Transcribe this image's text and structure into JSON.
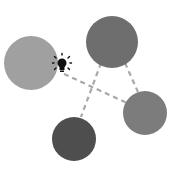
{
  "diagram": {
    "nodes": [
      {
        "id": "left",
        "cx": 31,
        "cy": 63,
        "r": 27,
        "color": "#a0a0a0"
      },
      {
        "id": "top",
        "cx": 112,
        "cy": 42,
        "r": 26,
        "color": "#6e6e6e"
      },
      {
        "id": "right",
        "cx": 145,
        "cy": 113,
        "r": 22,
        "color": "#7c7c7c"
      },
      {
        "id": "bottom",
        "cx": 74,
        "cy": 139,
        "r": 22,
        "color": "#4e4e4e"
      }
    ],
    "edges": [
      {
        "from": "left-bulb",
        "to": "right",
        "style": "dashed"
      },
      {
        "from": "top",
        "to": "bottom",
        "style": "dashed"
      },
      {
        "from": "top",
        "to": "right",
        "style": "dashed"
      }
    ],
    "edge_color": "#a8a8a8",
    "icon": {
      "name": "lightbulb-icon",
      "cx": 62,
      "cy": 65,
      "color": "#111111"
    }
  }
}
